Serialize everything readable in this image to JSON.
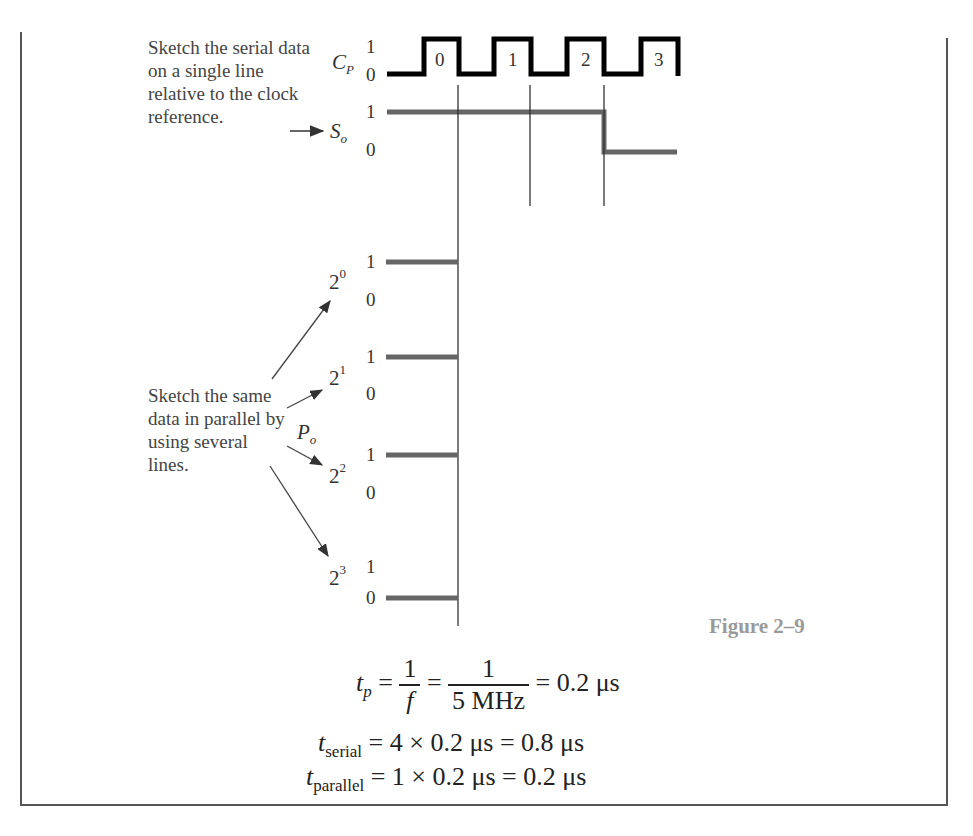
{
  "figure": {
    "label": "Figure 2–9",
    "colors": {
      "clock": "#000000",
      "data": "#666666",
      "text_note": "#444444",
      "figure_label": "#9a9a9a",
      "frame": "#555555"
    }
  },
  "notes": {
    "serial": "Sketch the serial data on a single line relative to the clock reference.",
    "parallel": "Sketch the same data in parallel by using several lines."
  },
  "signals": {
    "clock": {
      "name_base": "C",
      "name_sub": "P",
      "high": "1",
      "low": "0",
      "pulses": [
        "0",
        "1",
        "2",
        "3"
      ]
    },
    "serial": {
      "name_base": "S",
      "name_sub": "o",
      "high": "1",
      "low": "0",
      "bits": [
        1,
        1,
        1,
        0
      ]
    },
    "parallel_group": {
      "name_base": "P",
      "name_sub": "o"
    },
    "parallel": [
      {
        "base": "2",
        "exp": "0",
        "high": "1",
        "low": "0",
        "value": 1
      },
      {
        "base": "2",
        "exp": "1",
        "high": "1",
        "low": "0",
        "value": 1
      },
      {
        "base": "2",
        "exp": "2",
        "high": "1",
        "low": "0",
        "value": 1
      },
      {
        "base": "2",
        "exp": "3",
        "high": "1",
        "low": "0",
        "value": 0
      }
    ]
  },
  "equations": {
    "tp": {
      "lhs_base": "t",
      "lhs_sub": "p",
      "eq1": "=",
      "f1_num": "1",
      "f1_den": "f",
      "eq2": "=",
      "f2_num": "1",
      "f2_den": "5 MHz",
      "rhs": "= 0.2 μs"
    },
    "serial": {
      "lhs_base": "t",
      "lhs_sub": "serial",
      "rhs": "= 4 × 0.2 μs = 0.8 μs"
    },
    "parallel": {
      "lhs_base": "t",
      "lhs_sub": "parallel",
      "rhs": "= 1 × 0.2 μs = 0.2 μs"
    }
  }
}
